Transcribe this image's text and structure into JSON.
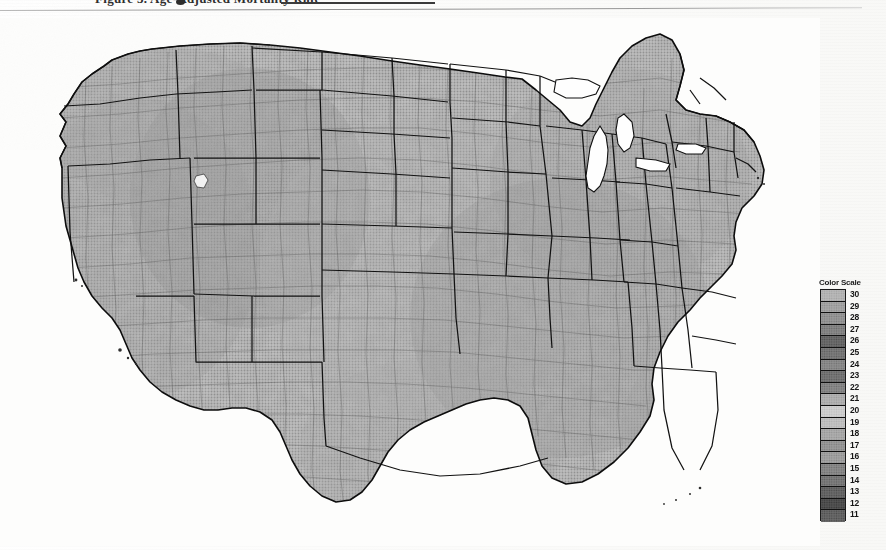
{
  "document": {
    "title_partial": "Figure 3.  Age-Adjusted Mortality Rate",
    "header_rule": "horizontal-rule"
  },
  "map": {
    "name": "contiguous-united-states-county-choropleth",
    "region": "Contiguous United States",
    "boundary_levels": [
      "state",
      "county"
    ],
    "rendering": "grayscale halftone / dithered photocopy",
    "waterbodies": [
      "Lake Michigan",
      "Lake Superior",
      "Lake Huron",
      "Lake Erie",
      "Lake Ontario",
      "Great Salt Lake"
    ]
  },
  "legend": {
    "title": "Color Scale",
    "orientation": "vertical",
    "entries": [
      {
        "label": "30",
        "color": "#b9b9b9"
      },
      {
        "label": "29",
        "color": "#a8a8a8"
      },
      {
        "label": "28",
        "color": "#9a9a9a"
      },
      {
        "label": "27",
        "color": "#8a8a8a"
      },
      {
        "label": "26",
        "color": "#6e6e6e"
      },
      {
        "label": "25",
        "color": "#7d7d7d"
      },
      {
        "label": "24",
        "color": "#8f8f8f"
      },
      {
        "label": "23",
        "color": "#7a7a7a"
      },
      {
        "label": "22",
        "color": "#8c8c8c"
      },
      {
        "label": "21",
        "color": "#b4b4b4"
      },
      {
        "label": "20",
        "color": "#d2d2d2"
      },
      {
        "label": "19",
        "color": "#c4c4c4"
      },
      {
        "label": "18",
        "color": "#aeaeae"
      },
      {
        "label": "17",
        "color": "#9c9c9c"
      },
      {
        "label": "16",
        "color": "#a5a5a5"
      },
      {
        "label": "15",
        "color": "#8d8d8d"
      },
      {
        "label": "14",
        "color": "#7f7f7f"
      },
      {
        "label": "13",
        "color": "#6b6b6b"
      },
      {
        "label": "12",
        "color": "#545454"
      },
      {
        "label": "11",
        "color": "#6a6a6a"
      }
    ],
    "max_value": "30",
    "min_value": "11"
  },
  "colors": {
    "page_background": "#fdfdfc",
    "ink": "#1a1a1a",
    "rule": "#9a9a9a",
    "state_border": "#141414",
    "county_border": "#5d5d5d",
    "water": "#ffffff"
  }
}
